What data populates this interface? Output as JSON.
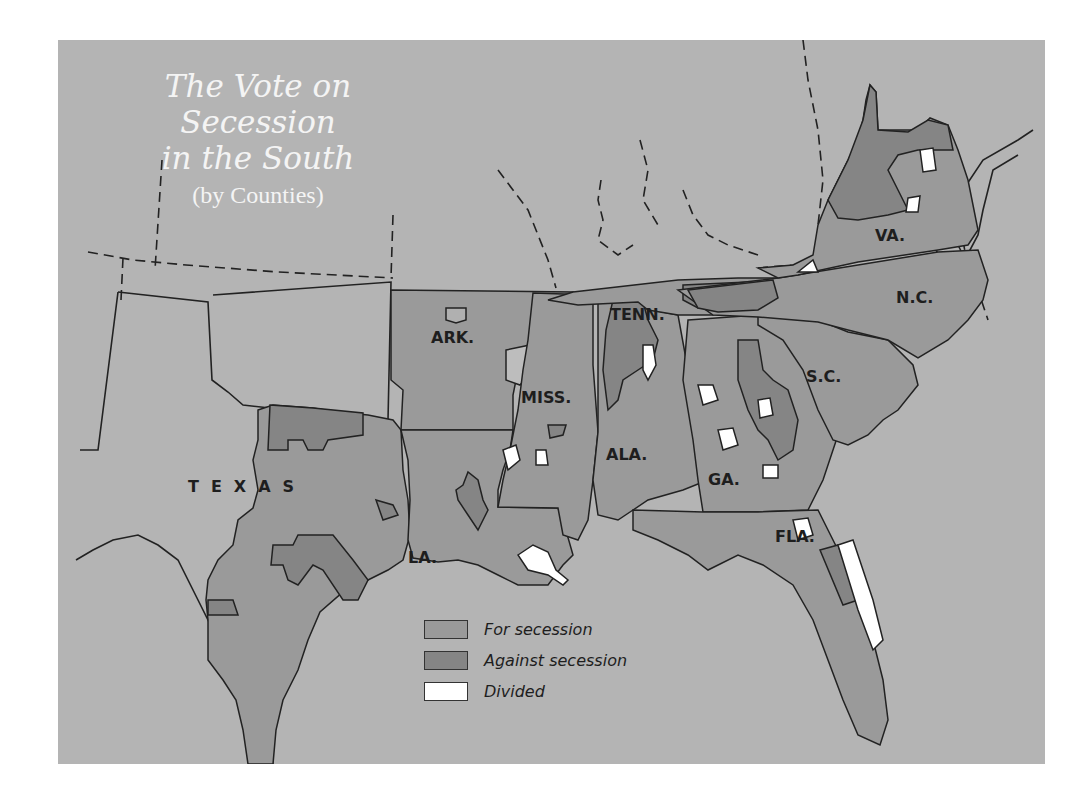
{
  "map": {
    "title_line1": "The Vote on Secession",
    "title_line2": "in the South",
    "subtitle": "(by Counties)",
    "colors": {
      "background": "#b4b4b4",
      "for_secession": "#9a9a9a",
      "against_secession": "#858585",
      "divided": "#ffffff",
      "border": "#222222"
    },
    "state_labels": {
      "texas": "TEXAS",
      "arkansas": "ARK.",
      "louisiana": "LA.",
      "mississippi": "MISS.",
      "alabama": "ALA.",
      "tennessee": "TENN.",
      "georgia": "GA.",
      "florida": "FLA.",
      "south_carolina": "S.C.",
      "north_carolina": "N.C.",
      "virginia": "VA."
    },
    "legend": [
      {
        "label": "For secession",
        "key": "for_secession"
      },
      {
        "label": "Against secession",
        "key": "against_secession"
      },
      {
        "label": "Divided",
        "key": "divided"
      }
    ]
  }
}
